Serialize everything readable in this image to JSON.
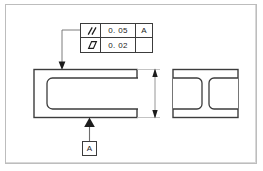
{
  "drawing": {
    "title": "GD&T parallelism and flatness callout drawing",
    "line_color": "#3c3c3c",
    "thin_line_color": "#9a9a9a",
    "border_color": "#bdbdbd",
    "background": "#ffffff"
  },
  "feature_control_frame": {
    "rows": [
      {
        "symbol_name": "parallelism-symbol",
        "symbol_label": "//",
        "tolerance": "0. 05",
        "datum": "A"
      },
      {
        "symbol_name": "flatness-symbol",
        "symbol_label": "flatness",
        "tolerance": "0. 02",
        "datum": ""
      }
    ]
  },
  "datum_feature": {
    "label": "A"
  },
  "views": {
    "front": {
      "name": "front-view",
      "description": "rectangular block with U-shaped slot open to the right"
    },
    "side": {
      "name": "side-view",
      "description": "rectangular block with two rounded pockets separated by a central rib"
    }
  },
  "dimension": {
    "name": "height-dimension",
    "value": "",
    "arrows": "double"
  }
}
